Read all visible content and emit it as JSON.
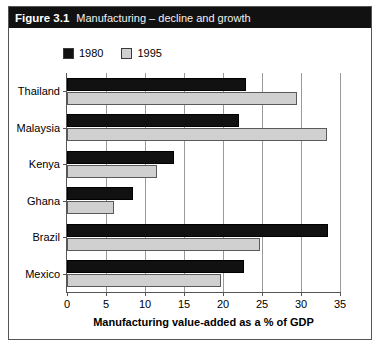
{
  "figure": {
    "number_label": "Figure 3.1",
    "title": "Manufacturing – decline and growth"
  },
  "legend": {
    "items": [
      {
        "label": "1980",
        "color": "#111111",
        "name": "legend-1980"
      },
      {
        "label": "1995",
        "color": "#d0d0d0",
        "name": "legend-1995"
      }
    ]
  },
  "chart_data": {
    "type": "bar",
    "orientation": "horizontal",
    "title": "Manufacturing – decline and growth",
    "xlabel": "Manufacturing value-added as a % of GDP",
    "ylabel": "",
    "categories": [
      "Thailand",
      "Malaysia",
      "Kenya",
      "Ghana",
      "Brazil",
      "Mexico"
    ],
    "series": [
      {
        "name": "1980",
        "color": "#111111",
        "values": [
          23,
          22,
          13.7,
          8.5,
          33.5,
          22.7
        ]
      },
      {
        "name": "1995",
        "color": "#d0d0d0",
        "values": [
          29.5,
          33.3,
          11.5,
          6,
          24.8,
          19.7
        ]
      }
    ],
    "xlim": [
      0,
      35
    ],
    "xticks": [
      0,
      5,
      10,
      15,
      20,
      25,
      30,
      35
    ],
    "xtick_labels": [
      "0",
      "5",
      "10",
      "15",
      "20",
      "25",
      "30",
      "35"
    ],
    "grid": "vertical",
    "legend_position": "top-left"
  }
}
